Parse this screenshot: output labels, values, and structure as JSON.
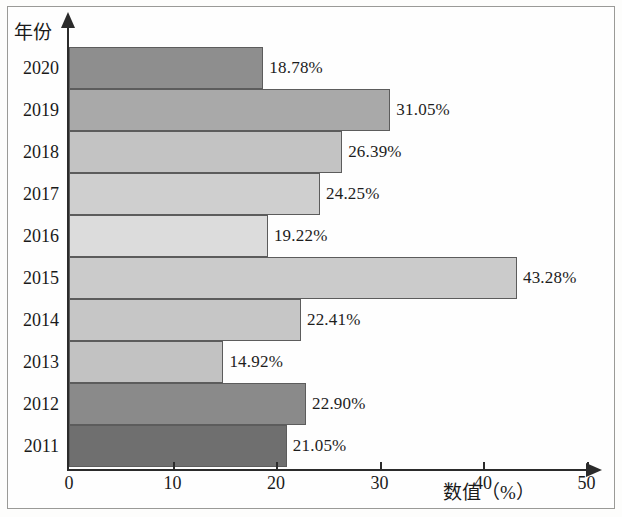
{
  "chart_data": {
    "type": "bar",
    "orientation": "horizontal",
    "title": "",
    "xlabel": "数值（%）",
    "ylabel": "年份",
    "categories": [
      "2020",
      "2019",
      "2018",
      "2017",
      "2016",
      "2015",
      "2014",
      "2013",
      "2012",
      "2011"
    ],
    "values": [
      18.78,
      31.05,
      26.39,
      24.25,
      19.22,
      43.28,
      22.41,
      14.92,
      22.9,
      21.05
    ],
    "value_labels": [
      "18.78%",
      "31.05%",
      "26.39%",
      "24.25%",
      "19.22%",
      "43.28%",
      "22.41%",
      "14.92%",
      "22.90%",
      "21.05%"
    ],
    "bar_colors": [
      "#8e8e8e",
      "#a9a9a9",
      "#c3c3c3",
      "#cfcfcf",
      "#dcdcdc",
      "#cbcbcb",
      "#c6c6c6",
      "#c2c2c2",
      "#8a8a8a",
      "#6f6f6f"
    ],
    "xlim": [
      0,
      50
    ],
    "xticks": [
      0,
      10,
      20,
      30,
      40,
      50
    ],
    "xticklabels": [
      "0",
      "10",
      "20",
      "30",
      "40",
      "50"
    ],
    "grid": false,
    "legend": false
  }
}
